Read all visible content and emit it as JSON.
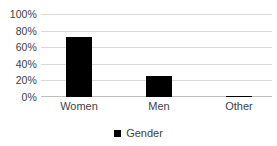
{
  "chart_data": {
    "type": "bar",
    "title": "",
    "subtitle": "",
    "xlabel": "",
    "ylabel": "",
    "categories": [
      "Women",
      "Men",
      "Other"
    ],
    "series": [
      {
        "name": "Gender",
        "color": "#000000",
        "values": [
          72,
          25,
          1.5
        ]
      }
    ],
    "ylim": [
      0,
      100
    ],
    "ytick_labels": [
      "100%",
      "80%",
      "60%",
      "40%",
      "20%",
      "0%"
    ],
    "ytick_values": [
      100,
      80,
      60,
      40,
      20,
      0
    ],
    "y_tick_format": "percent",
    "grid": true,
    "grid_axis": "y",
    "legend": {
      "visible": true,
      "position": "bottom",
      "entries": [
        {
          "label": "Gender",
          "marker": "square",
          "color": "#000000"
        }
      ]
    },
    "axis_line_color": "#bfbfbf",
    "gridline_color": "#d9d9d9",
    "background": "#ffffff"
  },
  "legend_entry_label": "Gender"
}
